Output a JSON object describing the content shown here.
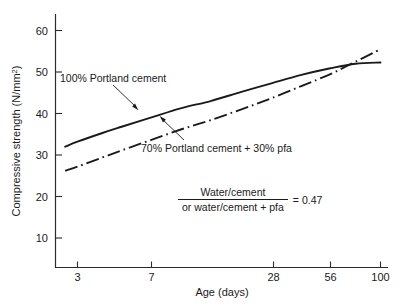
{
  "chart_data": {
    "type": "line",
    "title": "",
    "xlabel": "Age (days)",
    "ylabel": "Compressive strength (N/mm²)",
    "x_scale": "log",
    "xticks": [
      3,
      7,
      28,
      56,
      100
    ],
    "xtick_labels": [
      "3",
      "7",
      "28",
      "56",
      "100"
    ],
    "yticks": [
      10,
      20,
      30,
      40,
      50,
      60
    ],
    "ytick_labels": [
      "10",
      "20",
      "30",
      "40",
      "50",
      "60"
    ],
    "ylim": [
      0,
      65
    ],
    "xlim": [
      2.3,
      105
    ],
    "grid": false,
    "legend_position": "inline-annotations",
    "series": [
      {
        "name": "100% Portland cement",
        "style": "solid",
        "x": [
          2.6,
          3,
          4,
          5,
          7,
          10,
          14,
          20,
          28,
          40,
          56,
          75,
          100
        ],
        "values": [
          32.0,
          33.2,
          35.3,
          36.8,
          39.0,
          41.3,
          43.0,
          45.2,
          47.2,
          49.3,
          50.9,
          52.0,
          52.3
        ]
      },
      {
        "name": "70% Portland cement + 30% pfa",
        "style": "dash-dot",
        "x": [
          2.6,
          3,
          4,
          5,
          7,
          10,
          14,
          20,
          28,
          40,
          56,
          75,
          100
        ],
        "values": [
          26.2,
          27.2,
          29.4,
          31.1,
          33.6,
          36.2,
          38.4,
          41.0,
          43.6,
          46.6,
          49.5,
          52.5,
          55.5
        ]
      }
    ],
    "annotations": [
      {
        "name": "100% Portland cement",
        "text": "100% Portland cement",
        "points_to_series": "100% Portland cement"
      },
      {
        "name": "70% Portland cement + 30% pfa",
        "text": "70% Portland cement + 30% pfa",
        "points_to_series": "70% Portland cement + 30% pfa"
      }
    ],
    "note": {
      "numerator": "Water/cement",
      "denominator": "or water/cement + pfa",
      "equals": "= 0.47"
    }
  }
}
